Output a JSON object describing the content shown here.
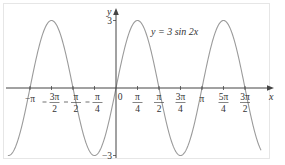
{
  "chart_data": {
    "type": "line",
    "title": "",
    "equation_label": "y = 3 sin 2x",
    "xlabel": "x",
    "ylabel": "y",
    "x_ticks": [
      {
        "value": -3.14159,
        "num": "−π",
        "den": ""
      },
      {
        "value": -2.35619,
        "num": "3π",
        "den": "2",
        "prefix": "−"
      },
      {
        "value": -1.5708,
        "num": "π",
        "den": "2",
        "prefix": "−"
      },
      {
        "value": -0.7854,
        "num": "π",
        "den": "4",
        "prefix": "−"
      },
      {
        "value": 0,
        "num": "0",
        "den": ""
      },
      {
        "value": 0.7854,
        "num": "π",
        "den": "4"
      },
      {
        "value": 1.5708,
        "num": "π",
        "den": "2"
      },
      {
        "value": 2.35619,
        "num": "3π",
        "den": "4"
      },
      {
        "value": 3.14159,
        "num": "π",
        "den": ""
      },
      {
        "value": 3.92699,
        "num": "5π",
        "den": "4"
      },
      {
        "value": 4.71239,
        "num": "3π",
        "den": "2"
      }
    ],
    "y_ticks": [
      {
        "value": 3,
        "label": "3"
      },
      {
        "value": -3,
        "label": "−3"
      }
    ],
    "xlim": [
      -3.9,
      5.4
    ],
    "ylim": [
      -3.4,
      3.4
    ],
    "grid": false,
    "series": [
      {
        "name": "y = 3 sin 2x",
        "function": "3*sin(2*x)",
        "amplitude": 3,
        "period": 3.14159,
        "color": "#9a9a9a"
      }
    ],
    "key_points": {
      "maxima_x": [
        -2.35619,
        0.7854,
        3.92699
      ],
      "minima_x": [
        -3.927,
        -0.7854,
        2.35619
      ],
      "zeros_x": [
        -3.14159,
        -1.5708,
        0,
        1.5708,
        3.14159,
        4.71239
      ]
    }
  },
  "colors": {
    "curve": "#9a9a9a",
    "axis": "#444444",
    "frame": "#e6e6e6",
    "text": "#333333"
  }
}
